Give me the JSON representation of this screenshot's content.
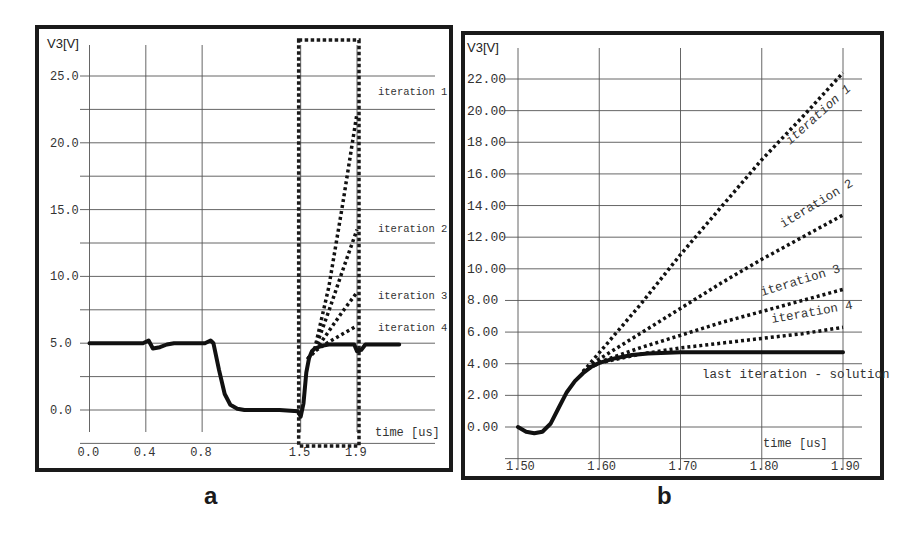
{
  "figure": {
    "panel_labels": [
      "a",
      "b"
    ]
  },
  "chart_data": [
    {
      "id": "a",
      "type": "line",
      "title": "",
      "ylabel": "V3[V]",
      "xlabel": "time [us]",
      "xlim": [
        -0.1,
        2.0
      ],
      "ylim": [
        -3.5,
        28.0
      ],
      "x_ticks": [
        0.0,
        0.4,
        0.8,
        1.5,
        1.9
      ],
      "x_tick_labels": [
        "0.0",
        "0.4",
        "0.8",
        "1.5",
        "1.9"
      ],
      "y_ticks": [
        0.0,
        5.0,
        10.0,
        15.0,
        20.0,
        25.0
      ],
      "y_tick_labels": [
        "0.0",
        "5.0",
        "10.0",
        "15.0",
        "20.0",
        "25.0"
      ],
      "grid": true,
      "zoom_box": {
        "x": [
          1.5,
          1.9
        ],
        "y": [
          -3.0,
          27.0
        ],
        "style": "dotted"
      },
      "annotations": [
        "iteration 1",
        "iteration 2",
        "iteration 3",
        "iteration 4"
      ],
      "series": [
        {
          "name": "solution",
          "style": "solid",
          "x": [
            0.0,
            0.38,
            0.42,
            0.45,
            0.5,
            0.55,
            0.6,
            0.75,
            0.82,
            0.86,
            0.88,
            0.92,
            0.96,
            1.0,
            1.05,
            1.1,
            1.2,
            1.35,
            1.48,
            1.5,
            1.52,
            1.54,
            1.56,
            1.58,
            1.6,
            1.65,
            1.7,
            1.8,
            1.86,
            1.88,
            1.9,
            1.93,
            1.96,
            2.05,
            2.2
          ],
          "y": [
            5.0,
            5.0,
            5.2,
            4.6,
            4.7,
            4.9,
            5.0,
            5.0,
            5.0,
            5.2,
            5.0,
            3.0,
            1.2,
            0.4,
            0.1,
            0.0,
            0.0,
            0.0,
            -0.1,
            -0.5,
            0.5,
            2.8,
            3.9,
            4.4,
            4.6,
            4.8,
            4.9,
            4.9,
            4.9,
            4.9,
            4.4,
            4.5,
            4.9,
            4.9,
            4.9
          ]
        },
        {
          "name": "iteration 1",
          "style": "dotted",
          "x": [
            1.55,
            1.6,
            1.7,
            1.8,
            1.9
          ],
          "y": [
            3.8,
            4.6,
            9.2,
            15.5,
            22.2
          ]
        },
        {
          "name": "iteration 2",
          "style": "dotted",
          "x": [
            1.55,
            1.6,
            1.7,
            1.8,
            1.9
          ],
          "y": [
            3.8,
            4.5,
            7.4,
            10.5,
            13.5
          ]
        },
        {
          "name": "iteration 3",
          "style": "dotted",
          "x": [
            1.55,
            1.6,
            1.7,
            1.8,
            1.9
          ],
          "y": [
            3.8,
            4.4,
            5.9,
            7.4,
            8.8
          ]
        },
        {
          "name": "iteration 4",
          "style": "dotted",
          "x": [
            1.55,
            1.6,
            1.7,
            1.8,
            1.9
          ],
          "y": [
            3.8,
            4.4,
            5.1,
            5.7,
            6.3
          ]
        }
      ]
    },
    {
      "id": "b",
      "type": "line",
      "title": "",
      "ylabel": "V3[V]",
      "xlabel": "time [us]",
      "xlim": [
        1.5,
        1.9
      ],
      "ylim": [
        -2.0,
        23.5
      ],
      "x_ticks": [
        1.5,
        1.6,
        1.7,
        1.8,
        1.9
      ],
      "x_tick_labels": [
        "1.50",
        "1.60",
        "1.70",
        "1.80",
        "1.90"
      ],
      "y_ticks": [
        0,
        2,
        4,
        6,
        8,
        10,
        12,
        14,
        16,
        18,
        20,
        22
      ],
      "y_tick_labels": [
        "0.00",
        "2.00",
        "4.00",
        "6.00",
        "8.00",
        "10.00",
        "12.00",
        "14.00",
        "16.00",
        "18.00",
        "20.00",
        "22.00"
      ],
      "grid": true,
      "annotations": [
        "iteration 1",
        "iteration 2",
        "iteration 3",
        "iteration 4",
        "last iteration - solution"
      ],
      "series": [
        {
          "name": "last iteration - solution",
          "style": "solid",
          "x": [
            1.5,
            1.51,
            1.52,
            1.53,
            1.54,
            1.55,
            1.56,
            1.57,
            1.58,
            1.59,
            1.6,
            1.62,
            1.64,
            1.66,
            1.7,
            1.75,
            1.8,
            1.9
          ],
          "y": [
            0.0,
            -0.3,
            -0.4,
            -0.3,
            0.2,
            1.2,
            2.2,
            2.9,
            3.4,
            3.8,
            4.05,
            4.35,
            4.55,
            4.65,
            4.72,
            4.72,
            4.72,
            4.72
          ]
        },
        {
          "name": "iteration 1",
          "style": "dotted",
          "x": [
            1.58,
            1.6,
            1.65,
            1.7,
            1.75,
            1.8,
            1.85,
            1.9
          ],
          "y": [
            3.5,
            4.7,
            7.7,
            10.9,
            13.9,
            16.9,
            19.6,
            22.4
          ]
        },
        {
          "name": "iteration 2",
          "style": "dotted",
          "x": [
            1.58,
            1.6,
            1.65,
            1.7,
            1.75,
            1.8,
            1.85,
            1.9
          ],
          "y": [
            3.5,
            4.3,
            5.9,
            7.5,
            9.1,
            10.6,
            12.0,
            13.4
          ]
        },
        {
          "name": "iteration 3",
          "style": "dotted",
          "x": [
            1.58,
            1.6,
            1.65,
            1.7,
            1.75,
            1.8,
            1.85,
            1.9
          ],
          "y": [
            3.5,
            4.1,
            5.0,
            5.8,
            6.6,
            7.3,
            8.0,
            8.7
          ]
        },
        {
          "name": "iteration 4",
          "style": "dotted",
          "x": [
            1.58,
            1.6,
            1.65,
            1.7,
            1.75,
            1.8,
            1.85,
            1.9
          ],
          "y": [
            3.5,
            4.05,
            4.6,
            5.0,
            5.3,
            5.6,
            5.9,
            6.3
          ]
        }
      ]
    }
  ]
}
